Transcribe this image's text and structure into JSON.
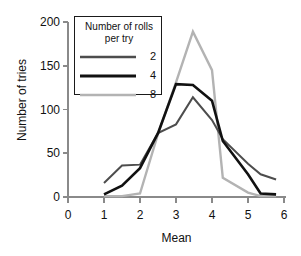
{
  "chart_data": {
    "type": "line",
    "title": "",
    "xlabel": "Mean",
    "ylabel": "Number of tries",
    "xlim": [
      0,
      6
    ],
    "ylim": [
      0,
      200
    ],
    "xticks": [
      "0",
      "1",
      "2",
      "3",
      "4",
      "5",
      "6"
    ],
    "yticks": [
      "0",
      "50",
      "100",
      "150",
      "200"
    ],
    "grid": false,
    "legend_position": "upper-left-inside",
    "legend_title": "Number of rolls per try",
    "legend_title_line1": "Number of rolls",
    "legend_title_line2": "per try",
    "series": [
      {
        "name": "2",
        "color": "#4d4d4d",
        "width": 2,
        "points": [
          [
            1.0,
            16
          ],
          [
            1.5,
            36
          ],
          [
            2.0,
            37
          ],
          [
            2.5,
            73
          ],
          [
            3.0,
            83
          ],
          [
            3.47,
            114
          ],
          [
            4.0,
            88
          ],
          [
            4.3,
            66
          ],
          [
            5.0,
            38
          ],
          [
            5.35,
            26
          ],
          [
            5.78,
            20
          ]
        ]
      },
      {
        "name": "4",
        "color": "#111111",
        "width": 2.6,
        "points": [
          [
            1.0,
            3
          ],
          [
            1.5,
            13
          ],
          [
            2.0,
            33
          ],
          [
            2.5,
            73
          ],
          [
            3.0,
            129
          ],
          [
            3.47,
            128
          ],
          [
            4.0,
            110
          ],
          [
            4.3,
            64
          ],
          [
            5.0,
            26
          ],
          [
            5.35,
            4
          ],
          [
            5.78,
            3
          ]
        ]
      },
      {
        "name": "8",
        "color": "#b3b3b3",
        "width": 2.4,
        "points": [
          [
            1.0,
            1
          ],
          [
            1.5,
            1
          ],
          [
            2.0,
            4
          ],
          [
            2.5,
            72
          ],
          [
            3.0,
            131
          ],
          [
            3.47,
            189
          ],
          [
            4.0,
            145
          ],
          [
            4.3,
            22
          ],
          [
            5.0,
            5
          ],
          [
            5.35,
            1
          ],
          [
            5.78,
            1
          ]
        ]
      }
    ]
  },
  "legend": {
    "entries": [
      {
        "label": "2"
      },
      {
        "label": "4"
      },
      {
        "label": "8"
      }
    ]
  },
  "axes": {
    "axis_color": "#8a8a8a"
  }
}
